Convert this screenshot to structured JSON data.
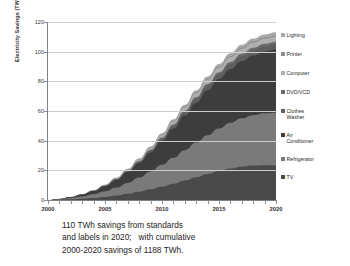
{
  "figure": {
    "caption_lines": [
      "110 TWh savings from standards",
      "and labels in 2020;   with cumulative",
      "2000-2020 savings of 1188 TWh."
    ]
  },
  "chart_data": {
    "type": "area",
    "stacked": true,
    "title": "",
    "xlabel": "",
    "ylabel": "Electricity Savings (TWh)",
    "xlim": [
      2000,
      2020
    ],
    "ylim": [
      0,
      120
    ],
    "grid": true,
    "legend_position": "right",
    "x_ticks": [
      "2000",
      "2005",
      "2010",
      "2015",
      "2020"
    ],
    "y_ticks": [
      "0",
      "20",
      "40",
      "60",
      "80",
      "100",
      "120"
    ],
    "x": [
      2000,
      2001,
      2002,
      2003,
      2004,
      2005,
      2006,
      2007,
      2008,
      2009,
      2010,
      2011,
      2012,
      2013,
      2014,
      2015,
      2016,
      2017,
      2018,
      2019,
      2020
    ],
    "series": [
      {
        "name": "TV",
        "color": "#4a4a4a",
        "values": [
          0,
          0.2,
          0.5,
          0.9,
          1.4,
          2.1,
          3.0,
          4.2,
          5.6,
          7.2,
          9.0,
          11.0,
          13.2,
          15.4,
          17.6,
          19.6,
          21.3,
          22.5,
          23.2,
          23.4,
          23.2
        ]
      },
      {
        "name": "Refrigerator",
        "color": "#7a7a7a",
        "values": [
          0,
          0.3,
          0.8,
          1.5,
          2.5,
          3.8,
          5.4,
          7.3,
          9.5,
          12.0,
          14.7,
          17.5,
          20.4,
          23.3,
          26.1,
          28.6,
          30.8,
          32.6,
          34.0,
          35.0,
          35.6
        ]
      },
      {
        "name": "Air Conditioner",
        "color": "#3d3d3d",
        "values": [
          0,
          0.2,
          0.6,
          1.2,
          2.1,
          3.4,
          5.1,
          7.3,
          9.9,
          12.9,
          16.2,
          19.7,
          23.3,
          26.9,
          30.3,
          33.4,
          36.1,
          38.4,
          40.2,
          41.6,
          42.6
        ]
      },
      {
        "name": "Clothes Washer",
        "color": "#5e5e5e",
        "values": [
          0,
          0.02,
          0.05,
          0.1,
          0.18,
          0.3,
          0.45,
          0.65,
          0.9,
          1.2,
          1.5,
          1.85,
          2.2,
          2.55,
          2.85,
          3.1,
          3.3,
          3.45,
          3.55,
          3.6,
          3.6
        ]
      },
      {
        "name": "DVD/VCD",
        "color": "#6b6b6b",
        "values": [
          0,
          0.01,
          0.03,
          0.06,
          0.1,
          0.16,
          0.24,
          0.34,
          0.46,
          0.6,
          0.76,
          0.92,
          1.08,
          1.24,
          1.38,
          1.5,
          1.6,
          1.68,
          1.72,
          1.75,
          1.75
        ]
      },
      {
        "name": "Computer",
        "color": "#b0b0b0",
        "values": [
          0,
          0.02,
          0.06,
          0.12,
          0.2,
          0.32,
          0.48,
          0.68,
          0.92,
          1.2,
          1.5,
          1.82,
          2.14,
          2.44,
          2.7,
          2.92,
          3.1,
          3.22,
          3.3,
          3.34,
          3.35
        ]
      },
      {
        "name": "Printer",
        "color": "#8f8f8f",
        "values": [
          0,
          0.005,
          0.015,
          0.03,
          0.05,
          0.08,
          0.12,
          0.17,
          0.23,
          0.3,
          0.38,
          0.46,
          0.54,
          0.61,
          0.68,
          0.73,
          0.78,
          0.81,
          0.83,
          0.84,
          0.85
        ]
      },
      {
        "name": "Lighting",
        "color": "#a8a8a8",
        "values": [
          0,
          0.01,
          0.03,
          0.07,
          0.12,
          0.2,
          0.3,
          0.42,
          0.57,
          0.75,
          0.95,
          1.15,
          1.35,
          1.54,
          1.7,
          1.84,
          1.95,
          2.02,
          2.07,
          2.09,
          2.1
        ]
      }
    ],
    "total_2020": 110,
    "cumulative_2000_2020": 1188,
    "annotation": "110 TWh savings from standards and labels in 2020;   with cumulative 2000-2020 savings of 1188 TWh."
  },
  "legend": {
    "items": [
      {
        "label": "Lighting",
        "color": "#a8a8a8"
      },
      {
        "label": "Printer",
        "color": "#8f8f8f"
      },
      {
        "label": "Computer",
        "color": "#b0b0b0"
      },
      {
        "label": "DVD/VCD",
        "color": "#6b6b6b"
      },
      {
        "label": "Clothes\nWasher",
        "color": "#5e5e5e"
      },
      {
        "label": "Air\nConditioner",
        "color": "#3d3d3d"
      },
      {
        "label": "Refrigerator",
        "color": "#7a7a7a"
      },
      {
        "label": "TV",
        "color": "#4a4a4a"
      }
    ]
  }
}
